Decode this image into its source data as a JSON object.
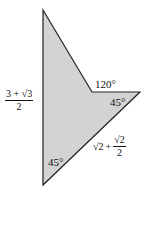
{
  "diagram": {
    "shape": "concave quadrilateral (arrowhead)",
    "fill": "#d3d3d3",
    "stroke": "#222222",
    "vertices": {
      "top": [
        43,
        10
      ],
      "notch": [
        92,
        92
      ],
      "right_tip": [
        140,
        92
      ],
      "bottom": [
        43,
        185
      ]
    }
  },
  "labels": {
    "left_side": {
      "numerator": "3 + √3",
      "denominator": "2"
    },
    "notch_angle": "120°",
    "right_tip_angle": "45°",
    "bottom_angle": "45°",
    "lower_right_side": {
      "whole": "√2",
      "plus": "+",
      "numerator": "√2",
      "denominator": "2"
    }
  }
}
